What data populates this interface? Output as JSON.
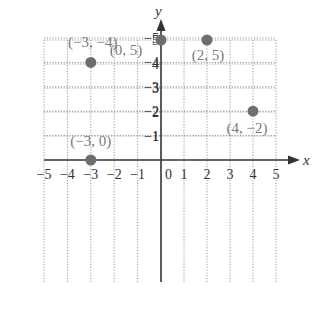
{
  "figure": {
    "title": "",
    "x_axis_label": "x",
    "y_axis_label": "y",
    "x_ticks": [
      "−5",
      "−4",
      "−3",
      "−2",
      "−1",
      "0",
      "1",
      "2",
      "3",
      "4",
      "5"
    ],
    "y_ticks": [
      "5",
      "4",
      "3",
      "2",
      "1",
      "−1",
      "−2",
      "−3",
      "−4",
      "−5"
    ],
    "origin_label": "0"
  },
  "chart_data": {
    "type": "scatter",
    "title": "",
    "xlabel": "x",
    "ylabel": "y",
    "xlim": [
      -5,
      5
    ],
    "ylim": [
      -5,
      5
    ],
    "grid": true,
    "points": [
      {
        "x": 0,
        "y": 5,
        "label": "(0, 5)"
      },
      {
        "x": 2,
        "y": 5,
        "label": "(2, 5)"
      },
      {
        "x": -3,
        "y": 0,
        "label": "(−3, 0)"
      },
      {
        "x": 4,
        "y": -2,
        "label": "(4, −2)"
      },
      {
        "x": -3,
        "y": -4,
        "label": "(−3, −4)"
      }
    ]
  },
  "colors": {
    "point": "#6e6e6e",
    "label": "#7a7a7a",
    "axis": "#333333",
    "grid": "#9a9a9a",
    "tick_text": "#333333"
  }
}
